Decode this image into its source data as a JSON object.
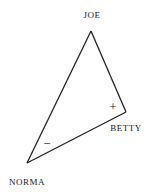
{
  "diagram": {
    "type": "balance-triangle",
    "line_color": "#222222",
    "nodes": [
      {
        "id": "joe",
        "label": "JOE",
        "x": 91,
        "y": 31,
        "label_x": 92,
        "label_y": 10
      },
      {
        "id": "betty",
        "label": "BETTY",
        "x": 126,
        "y": 112,
        "label_x": 126,
        "label_y": 123
      },
      {
        "id": "norma",
        "label": "NORMA",
        "x": 27,
        "y": 163,
        "label_x": 27,
        "label_y": 177
      }
    ],
    "edges": [
      {
        "from": "joe",
        "to": "betty"
      },
      {
        "from": "joe",
        "to": "norma"
      },
      {
        "from": "norma",
        "to": "betty"
      }
    ],
    "signs": [
      {
        "symbol": "+",
        "x": 113,
        "y": 107,
        "near": "betty"
      },
      {
        "symbol": "−",
        "x": 47,
        "y": 143,
        "near": "norma"
      }
    ]
  }
}
